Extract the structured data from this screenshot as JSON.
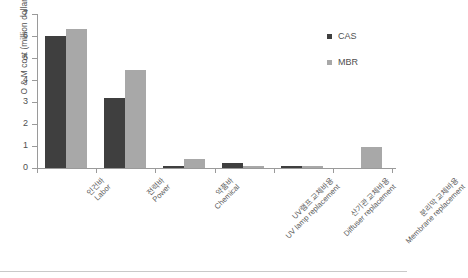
{
  "chart_data": {
    "type": "bar",
    "title": "",
    "xlabel": "",
    "ylabel": "O & M cost (million dollars)",
    "ylim": [
      0,
      7
    ],
    "yticks": [
      "0",
      "1",
      "2",
      "3",
      "4",
      "5",
      "6",
      "7"
    ],
    "grid": false,
    "legend_position": "top-right",
    "categories": [
      "인건바 Labor",
      "전력바 Power",
      "약품바 Chemical",
      "UV램프 교체바용 UV lamp replacement",
      "산기관 교체바용 Diffuser replacement",
      "분리막 교체바용 Membrane replacement"
    ],
    "category_labels": [
      {
        "ko": "인건바",
        "en": "Labor"
      },
      {
        "ko": "전력바",
        "en": "Power"
      },
      {
        "ko": "약품바",
        "en": "Chemical"
      },
      {
        "ko": "UV램프 교체바용",
        "en": "UV lamp replacement"
      },
      {
        "ko": "산기관 교체바용",
        "en": "Diffuser replacement"
      },
      {
        "ko": "분리막 교체바용",
        "en": "Membrane replacement"
      }
    ],
    "series": [
      {
        "name": "CAS",
        "color": "#3f3f3f",
        "values": [
          6.0,
          3.2,
          0.1,
          0.25,
          0.1,
          0.0
        ]
      },
      {
        "name": "MBR",
        "color": "#a8a8a8",
        "values": [
          6.3,
          4.45,
          0.4,
          0.1,
          0.08,
          0.95
        ]
      }
    ]
  },
  "legend": {
    "entries": [
      {
        "label": "CAS"
      },
      {
        "label": "MBR"
      }
    ]
  },
  "colors": {
    "cas": "#3f3f3f",
    "mbr": "#a8a8a8",
    "axis": "#9a9a9a",
    "text": "#4f4f4f"
  }
}
